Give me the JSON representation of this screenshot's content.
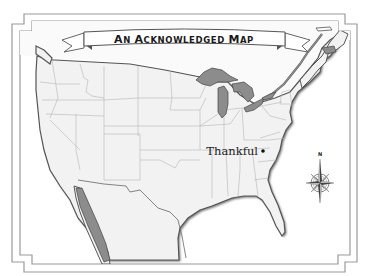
{
  "map": {
    "title_parts": {
      "a1": "A",
      "a2": "N ",
      "b1": "A",
      "b2": "CKNOWLEDGED ",
      "c1": "M",
      "c2": "AP"
    },
    "title_full": "An Acknowledged Map",
    "region": "Contiguous United States with northern Mexico and southeastern Canada",
    "marker": {
      "label": "Thankful",
      "type": "point",
      "location_hint": "North Carolina / Virginia area"
    },
    "compass": {
      "north_label": "N"
    },
    "colors": {
      "land": "#f2f2f2",
      "water_bodies": "#8c8c8c",
      "borders": "#b5b5b5",
      "coastline": "#555555",
      "frame": "#9a9a9a",
      "background": "#ffffff"
    }
  }
}
